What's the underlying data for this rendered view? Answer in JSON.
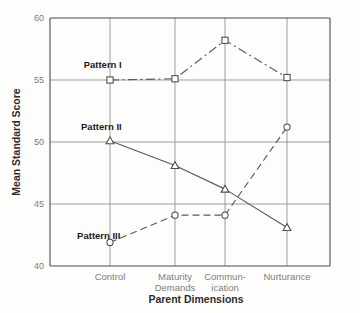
{
  "chart_data": {
    "type": "line",
    "title": "",
    "xlabel": "Parent Dimensions",
    "ylabel": "Mean Standard Score",
    "categories": [
      "Control",
      "Maturity Demands",
      "Commun-ication",
      "Nurturance"
    ],
    "category_lines": [
      [
        "Control"
      ],
      [
        "Maturity",
        "Demands"
      ],
      [
        "Commun-",
        "ication"
      ],
      [
        "Nurturance"
      ]
    ],
    "ylim": [
      40,
      60
    ],
    "yticks": [
      40,
      45,
      50,
      55,
      60
    ],
    "ytick_labels": [
      "40",
      "45",
      "50",
      "55",
      "60"
    ],
    "grid": true,
    "legend": "inline-labels",
    "series": [
      {
        "name": "Pattern I",
        "values": [
          55.0,
          55.1,
          58.2,
          55.2
        ],
        "marker": "square",
        "linestyle": "dash-dot",
        "color": "#5a5a5a",
        "label_x": 0.18,
        "label_y": 55.95
      },
      {
        "name": "Pattern II",
        "values": [
          50.1,
          48.1,
          46.2,
          43.1
        ],
        "marker": "triangle",
        "linestyle": "solid",
        "color": "#5a5a5a",
        "label_x": 0.18,
        "label_y": 50.95
      },
      {
        "name": "Pattern III",
        "values": [
          41.9,
          44.1,
          44.1,
          51.2
        ],
        "marker": "circle",
        "linestyle": "dashed",
        "color": "#5a5a5a",
        "label_x": 0.16,
        "label_y": 42.2
      }
    ]
  }
}
